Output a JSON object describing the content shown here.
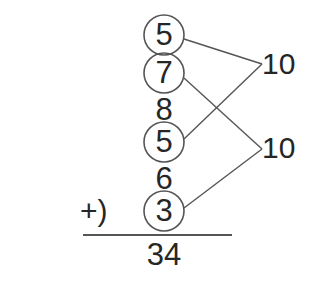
{
  "problem": {
    "type": "vertical-addition-with-number-bonds",
    "operator": "+)",
    "addends": [
      {
        "value": "5",
        "circled": true
      },
      {
        "value": "7",
        "circled": true
      },
      {
        "value": "8",
        "circled": false
      },
      {
        "value": "5",
        "circled": true
      },
      {
        "value": "6",
        "circled": false
      },
      {
        "value": "3",
        "circled": true
      }
    ],
    "bonds": [
      {
        "label": "10",
        "from_indices": [
          0,
          3
        ]
      },
      {
        "label": "10",
        "from_indices": [
          1,
          5
        ]
      }
    ],
    "total": "34"
  },
  "colors": {
    "ink": "#262626",
    "stroke": "#555555",
    "background": "#ffffff"
  }
}
